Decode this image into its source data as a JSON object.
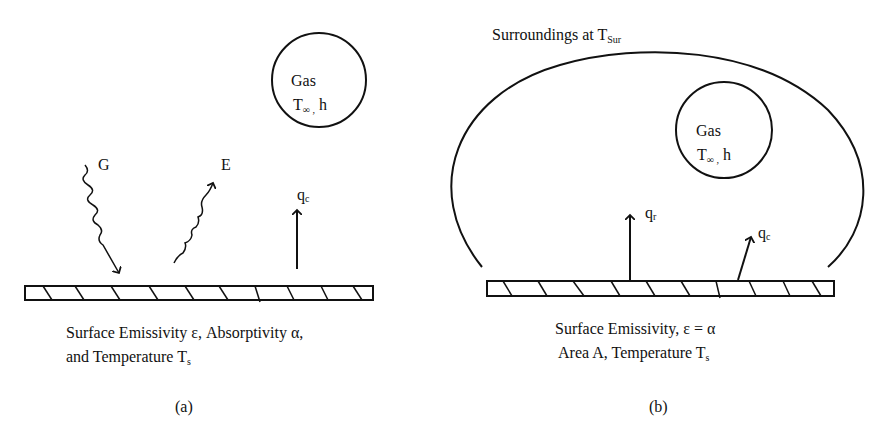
{
  "panel_a": {
    "gas_label": "Gas",
    "gas_params": "T",
    "gas_params_sub": "∞ ,",
    "gas_params_tail": " h",
    "irradiation_label": "G",
    "emission_label": "E",
    "convection_label": "q",
    "convection_sub": "c",
    "caption_line1": "Surface Emissivity ε, Absorptivity α,",
    "caption_line2": "and Temperature T",
    "caption_line2_sub": "s",
    "panel_label": "(a)"
  },
  "panel_b": {
    "surroundings_label": "Surroundings at T",
    "surroundings_sub": "Sur",
    "gas_label": "Gas",
    "gas_params": "T",
    "gas_params_sub": "∞ ,",
    "gas_params_tail": " h",
    "radiation_label": "q",
    "radiation_sub": "r",
    "convection_label": "q",
    "convection_sub": "c",
    "caption_line1": "Surface Emissivity,  ε = α",
    "caption_line2": "Area A, Temperature T",
    "caption_line2_sub": "s",
    "panel_label": "(b)"
  }
}
